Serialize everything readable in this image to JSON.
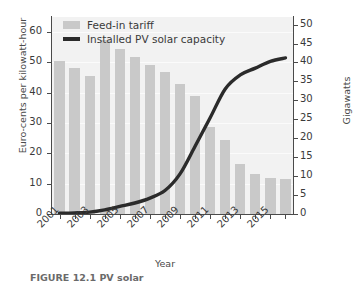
{
  "chart_data": {
    "type": "bar",
    "title": "",
    "xlabel": "Year",
    "ylabel": "Euro-cents per kilowatt-hour",
    "y2label": "Gigawatts",
    "grid": true,
    "legend_position": "top-left",
    "categories": [
      "2001",
      "2002",
      "2003",
      "2004",
      "2005",
      "2006",
      "2007",
      "2008",
      "2009",
      "2010",
      "2011",
      "2012",
      "2013",
      "2014",
      "2015",
      "2016"
    ],
    "xtick_labels": [
      "2001",
      "2003",
      "2005",
      "2007",
      "2009",
      "2011",
      "2013",
      "2015"
    ],
    "ylim": [
      0,
      65
    ],
    "ytick_labels": [
      "0",
      "10",
      "20",
      "30",
      "40",
      "50",
      "60"
    ],
    "ytick_values": [
      0,
      10,
      20,
      30,
      40,
      50,
      60
    ],
    "y2lim": [
      0,
      52
    ],
    "y2tick_labels": [
      "0",
      "5",
      "10",
      "15",
      "20",
      "25",
      "30",
      "35",
      "40",
      "45",
      "50"
    ],
    "y2tick_values": [
      0,
      5,
      10,
      15,
      20,
      25,
      30,
      35,
      40,
      45,
      50
    ],
    "series": [
      {
        "name": "Feed-in tariff",
        "type": "bar",
        "axis": "left",
        "unit": "Euro-cents per kilowatt-hour",
        "color": "#c9c9c9",
        "values": [
          50.6,
          48.1,
          45.7,
          57.4,
          54.5,
          51.8,
          49.2,
          46.8,
          43.0,
          39.1,
          28.7,
          24.4,
          16.6,
          13.2,
          11.8,
          11.5
        ]
      },
      {
        "name": "Installed PV solar capacity",
        "type": "line",
        "axis": "right",
        "unit": "Gigawatts",
        "color": "#2b2b2b",
        "values": [
          0.2,
          0.3,
          0.5,
          1.1,
          2.0,
          2.9,
          4.2,
          6.2,
          10.6,
          17.9,
          25.4,
          33.0,
          36.7,
          38.5,
          40.3,
          41.2
        ]
      }
    ]
  },
  "legend": {
    "items": [
      {
        "label": "Feed-in tariff",
        "marker": "bar-swatch"
      },
      {
        "label": "Installed PV solar capacity",
        "marker": "line-swatch"
      }
    ]
  },
  "caption": {
    "text": "FIGURE 12.1 PV solar"
  }
}
